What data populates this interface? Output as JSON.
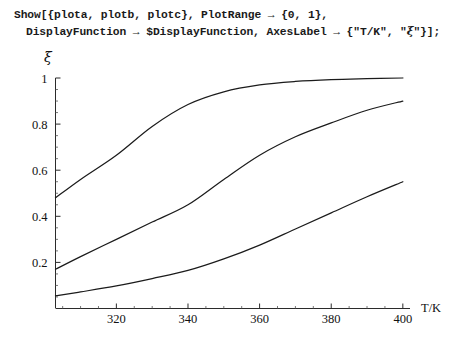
{
  "notebook": {
    "code_lines": [
      "Show[{plota, plotb, plotc}, PlotRange → {0, 1},",
      "DisplayFunction → $DisplayFunction, AxesLabel → {\"T/K\", \"ξ\"}];"
    ],
    "line1_text": "Show[{plota, plotb, plotc}, PlotRange → {0, 1},",
    "line2_prefix": "DisplayFunction → $DisplayFunction, AxesLabel → {\"T/K\", \"",
    "line2_xi": "ξ",
    "line2_suffix": "\"}];"
  },
  "chart_data": {
    "type": "line",
    "title": "",
    "xlabel": "T/K",
    "ylabel": "ξ",
    "xlim": [
      303,
      402
    ],
    "ylim": [
      0,
      1
    ],
    "grid": false,
    "legend": "none",
    "xticks": [
      320,
      340,
      360,
      380,
      400
    ],
    "xtick_labels": [
      "320",
      "340",
      "360",
      "380",
      "400"
    ],
    "xminor_step": 5,
    "yticks": [
      0.2,
      0.4,
      0.6,
      0.8,
      1
    ],
    "ytick_labels": [
      "0.2",
      "0.4",
      "0.6",
      "0.8",
      "1"
    ],
    "yminor_step": 0.05,
    "x": [
      303,
      310,
      320,
      330,
      340,
      350,
      360,
      370,
      380,
      390,
      400
    ],
    "series": [
      {
        "name": "plota",
        "values": [
          0.48,
          0.56,
          0.665,
          0.79,
          0.885,
          0.94,
          0.97,
          0.985,
          0.993,
          0.997,
          1.0
        ]
      },
      {
        "name": "plotb",
        "values": [
          0.17,
          0.225,
          0.3,
          0.375,
          0.45,
          0.56,
          0.665,
          0.745,
          0.805,
          0.86,
          0.9
        ]
      },
      {
        "name": "plotc",
        "values": [
          0.055,
          0.072,
          0.098,
          0.13,
          0.165,
          0.215,
          0.275,
          0.345,
          0.415,
          0.485,
          0.55
        ]
      }
    ]
  },
  "axis": {
    "x_label": "T/K",
    "y_label": "ξ"
  }
}
